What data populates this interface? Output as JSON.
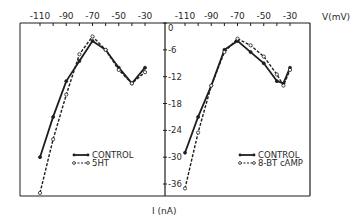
{
  "figure": {
    "x_axis_label": "V(mV)",
    "y_axis_label": "I (nA)",
    "x_ticks": [
      -110,
      -90,
      -70,
      -50,
      -30
    ],
    "x_tick_labels": [
      "-110",
      "-90",
      "-70",
      "-50",
      "-30"
    ],
    "y_ticks": [
      0,
      -6,
      -12,
      -18,
      -24,
      -30,
      -36
    ],
    "y_tick_labels": [
      "0",
      "-6",
      "-12",
      "-18",
      "-24",
      "-30",
      "-36"
    ]
  },
  "chart_data": [
    {
      "type": "line",
      "panel": "left",
      "title": "",
      "xlabel": "V(mV)",
      "ylabel": "I (nA)",
      "xlim": [
        -120,
        -20
      ],
      "ylim": [
        -38,
        0
      ],
      "x_ticks": [
        -110,
        -90,
        -70,
        -50,
        -30
      ],
      "y_ticks": [
        0,
        -6,
        -12,
        -18,
        -24,
        -30,
        -36
      ],
      "grid": false,
      "legend_position": "lower right",
      "series": [
        {
          "name": "CONTROL",
          "style": "solid, filled dots",
          "x": [
            -110,
            -100,
            -90,
            -80,
            -70,
            -60,
            -50,
            -40,
            -30
          ],
          "y": [
            -30,
            -21,
            -13,
            -8.5,
            -4,
            -6,
            -10,
            -13.5,
            -10
          ]
        },
        {
          "name": "5HT",
          "style": "dashed, open circles",
          "x": [
            -110,
            -100,
            -90,
            -80,
            -70,
            -60,
            -50,
            -40,
            -30
          ],
          "y": [
            -38,
            -26,
            -16,
            -7,
            -3,
            -6,
            -10.5,
            -13.5,
            -11
          ]
        }
      ]
    },
    {
      "type": "line",
      "panel": "right",
      "title": "",
      "xlabel": "V(mV)",
      "ylabel": "I (nA)",
      "xlim": [
        -120,
        -20
      ],
      "ylim": [
        -38,
        0
      ],
      "x_ticks": [
        -110,
        -90,
        -70,
        -50,
        -30
      ],
      "y_ticks": [
        0,
        -6,
        -12,
        -18,
        -24,
        -30,
        -36
      ],
      "grid": false,
      "legend_position": "lower right",
      "series": [
        {
          "name": "CONTROL",
          "style": "solid, filled dots",
          "x": [
            -110,
            -100,
            -90,
            -80,
            -70,
            -60,
            -50,
            -40,
            -35,
            -30
          ],
          "y": [
            -29,
            -21,
            -14,
            -6,
            -4,
            -6.5,
            -9,
            -13,
            -13.5,
            -10
          ]
        },
        {
          "name": "8-BT cAMP",
          "style": "dashed, open circles",
          "x": [
            -110,
            -100,
            -90,
            -80,
            -70,
            -60,
            -50,
            -40,
            -35,
            -30
          ],
          "y": [
            -37,
            -24.5,
            -14,
            -6.5,
            -3.5,
            -5,
            -7.5,
            -11.5,
            -14,
            -10.5
          ]
        }
      ]
    }
  ]
}
